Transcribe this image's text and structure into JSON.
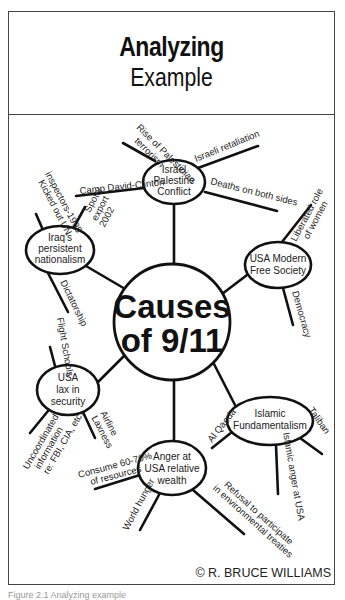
{
  "title": {
    "main": "Analyzing",
    "sub": "Example"
  },
  "center": {
    "line1": "Causes",
    "line2": "of 9/11"
  },
  "nodes": {
    "israel": {
      "lines": [
        "Israel",
        "Palestine",
        "Conflict"
      ],
      "branches": [
        "Rise of Palestinian terrorism",
        "Israeli retaliation",
        "Camp David-Clinton",
        "Deaths on both sides"
      ]
    },
    "iraq": {
      "lines": [
        "Iraq's",
        "persistent",
        "nationalism"
      ],
      "branches": [
        "Kicked out UN inspectors-1998",
        "Spotty export 2002",
        "Dictatorship"
      ]
    },
    "usa_modern": {
      "lines": [
        "USA Modern",
        "Free Society"
      ],
      "branches": [
        "Liberated role of women",
        "Democracy"
      ]
    },
    "usa_lax": {
      "lines": [
        "USA",
        "lax in",
        "security"
      ],
      "branches": [
        "Flight Schools",
        "Airline Laxness",
        "Uncoordinated information re: FBI, CIA, etc."
      ]
    },
    "islamic": {
      "lines": [
        "Islamic",
        "Fundamentalism"
      ],
      "branches": [
        "Al Qaeda",
        "Taliban",
        "Islamic anger at USA"
      ]
    },
    "anger": {
      "lines": [
        "Anger at",
        "USA relative",
        "wealth"
      ],
      "branches": [
        "Consume 60-70% of resources",
        "World hunger",
        "Refusal to participate in environmental treaties"
      ]
    }
  },
  "branch_text": {
    "rise1": "Rise of Palestinian",
    "rise2": "terrorism",
    "retaliation": "Israeli retaliation",
    "camp": "Camp David-Clinton",
    "deaths": "Deaths on both sides",
    "kicked1": "Kicked out UN",
    "kicked2": "inspectors-1998",
    "spotty1": "Spotty",
    "spotty2": "export",
    "spotty3": "2002",
    "dictatorship": "Dictatorship",
    "women1": "Liberated role",
    "women2": "of women",
    "democracy": "Democracy",
    "flight": "Flight Schools",
    "airline1": "Airline",
    "airline2": "Laxness",
    "uncoord1": "Uncoordinated",
    "uncoord2": "information",
    "uncoord3": "re: FBI, CIA, etc.",
    "alqaeda": "Al Qaeda",
    "taliban": "Taliban",
    "islamic_anger": "Islamic anger at USA",
    "consume1": "Consume 60-70%",
    "consume2": "of resources",
    "hunger": "World hunger",
    "refusal1": "Refusal to participate",
    "refusal2": "in environmental treaties"
  },
  "credit": "© R. BRUCE WILLIAMS",
  "caption": "Figure 2.1   Analyzing example"
}
